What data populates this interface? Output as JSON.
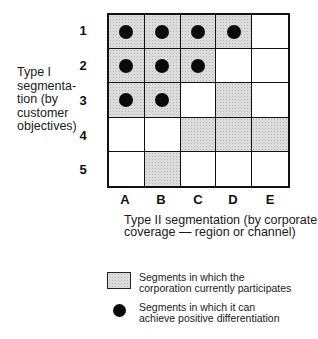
{
  "diagram": {
    "y_axis_label": [
      "Type I",
      "segmenta-",
      "tion (by",
      "customer",
      "objectives)"
    ],
    "x_axis_label": [
      "Type II segmentation (by corporate",
      "coverage — region or channel)"
    ],
    "rows": [
      "1",
      "2",
      "3",
      "4",
      "5"
    ],
    "columns": [
      "A",
      "B",
      "C",
      "D",
      "E"
    ],
    "cells": [
      [
        {
          "shaded": true,
          "dot": true
        },
        {
          "shaded": true,
          "dot": true
        },
        {
          "shaded": true,
          "dot": true
        },
        {
          "shaded": true,
          "dot": true
        },
        {
          "shaded": false,
          "dot": false
        }
      ],
      [
        {
          "shaded": true,
          "dot": true
        },
        {
          "shaded": true,
          "dot": true
        },
        {
          "shaded": true,
          "dot": true
        },
        {
          "shaded": false,
          "dot": false
        },
        {
          "shaded": false,
          "dot": false
        }
      ],
      [
        {
          "shaded": true,
          "dot": true
        },
        {
          "shaded": true,
          "dot": true
        },
        {
          "shaded": false,
          "dot": false
        },
        {
          "shaded": true,
          "dot": false
        },
        {
          "shaded": false,
          "dot": false
        }
      ],
      [
        {
          "shaded": false,
          "dot": false
        },
        {
          "shaded": false,
          "dot": false
        },
        {
          "shaded": true,
          "dot": false
        },
        {
          "shaded": true,
          "dot": false
        },
        {
          "shaded": true,
          "dot": false
        }
      ],
      [
        {
          "shaded": false,
          "dot": false
        },
        {
          "shaded": true,
          "dot": false
        },
        {
          "shaded": false,
          "dot": false
        },
        {
          "shaded": false,
          "dot": false
        },
        {
          "shaded": false,
          "dot": false
        }
      ]
    ],
    "legend": [
      {
        "symbol": "shaded-square",
        "lines": [
          "Segments in which the",
          "corporation currently participates"
        ]
      },
      {
        "symbol": "black-dot",
        "lines": [
          "Segments in which it can",
          "achieve positive differentiation"
        ]
      }
    ],
    "colors": {
      "shade": "#dcdcdc",
      "dot": "#0a0a0a",
      "line": "#111111"
    }
  }
}
